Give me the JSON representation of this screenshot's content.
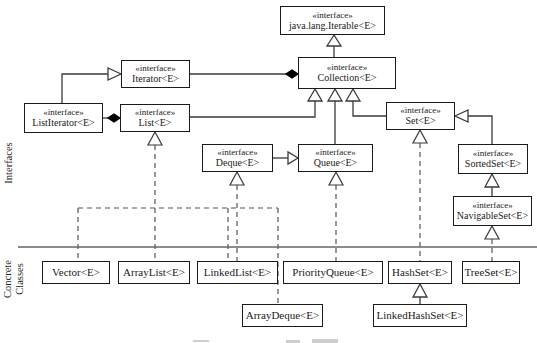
{
  "diagram": {
    "sections": {
      "interfaces": "Interfaces",
      "concrete": "Concrete Classes"
    },
    "stereotype": "«interface»",
    "nodes": {
      "iterable": {
        "stereotype": "«interface»",
        "label": "java.lang.Iterable<E>"
      },
      "iterator": {
        "stereotype": "«interface»",
        "label": "Iterator<E>"
      },
      "collection": {
        "stereotype": "«interface»",
        "label": "Collection<E>"
      },
      "listiterator": {
        "stereotype": "«interface»",
        "label": "ListIterator<E>"
      },
      "list": {
        "stereotype": "«interface»",
        "label": "List<E>"
      },
      "set": {
        "stereotype": "«interface»",
        "label": "Set<E>"
      },
      "deque": {
        "stereotype": "«interface»",
        "label": "Deque<E>"
      },
      "queue": {
        "stereotype": "«interface»",
        "label": "Queue<E>"
      },
      "sortedset": {
        "stereotype": "«interface»",
        "label": "SortedSet<E>"
      },
      "navigableset": {
        "stereotype": "«interface»",
        "label": "NavigableSet<E>"
      },
      "vector": {
        "label": "Vector<E>"
      },
      "arraylist": {
        "label": "ArrayList<E>"
      },
      "linkedlist": {
        "label": "LinkedList<E>"
      },
      "priorityqueue": {
        "label": "PriorityQueue<E>"
      },
      "hashset": {
        "label": "HashSet<E>"
      },
      "treeset": {
        "label": "TreeSet<E>"
      },
      "arraydeque": {
        "label": "ArrayDeque<E>"
      },
      "linkedhashset": {
        "label": "LinkedHashSet<E>"
      }
    },
    "edges": [
      {
        "from": "Collection<E>",
        "to": "java.lang.Iterable<E>",
        "type": "extends"
      },
      {
        "from": "ListIterator<E>",
        "to": "Iterator<E>",
        "type": "extends"
      },
      {
        "from": "Collection<E>",
        "to": "Iterator<E>",
        "type": "aggregation"
      },
      {
        "from": "List<E>",
        "to": "ListIterator<E>",
        "type": "aggregation"
      },
      {
        "from": "List<E>",
        "to": "Collection<E>",
        "type": "extends"
      },
      {
        "from": "Queue<E>",
        "to": "Collection<E>",
        "type": "extends"
      },
      {
        "from": "Set<E>",
        "to": "Collection<E>",
        "type": "extends"
      },
      {
        "from": "Deque<E>",
        "to": "Queue<E>",
        "type": "extends"
      },
      {
        "from": "SortedSet<E>",
        "to": "Set<E>",
        "type": "extends"
      },
      {
        "from": "NavigableSet<E>",
        "to": "SortedSet<E>",
        "type": "extends"
      },
      {
        "from": "Vector<E>",
        "to": "List<E>",
        "type": "implements"
      },
      {
        "from": "ArrayList<E>",
        "to": "List<E>",
        "type": "implements"
      },
      {
        "from": "LinkedList<E>",
        "to": "List<E>",
        "type": "implements"
      },
      {
        "from": "LinkedList<E>",
        "to": "Deque<E>",
        "type": "implements"
      },
      {
        "from": "ArrayDeque<E>",
        "to": "Deque<E>",
        "type": "implements"
      },
      {
        "from": "PriorityQueue<E>",
        "to": "Queue<E>",
        "type": "implements"
      },
      {
        "from": "HashSet<E>",
        "to": "Set<E>",
        "type": "implements"
      },
      {
        "from": "TreeSet<E>",
        "to": "NavigableSet<E>",
        "type": "implements"
      },
      {
        "from": "LinkedHashSet<E>",
        "to": "HashSet<E>",
        "type": "extends"
      }
    ],
    "colors": {
      "box_border": "#1a1a1a",
      "solid_line": "#3a3a3a",
      "dashed_line": "#555555",
      "separator": "#666666",
      "background": "#ffffff"
    }
  }
}
